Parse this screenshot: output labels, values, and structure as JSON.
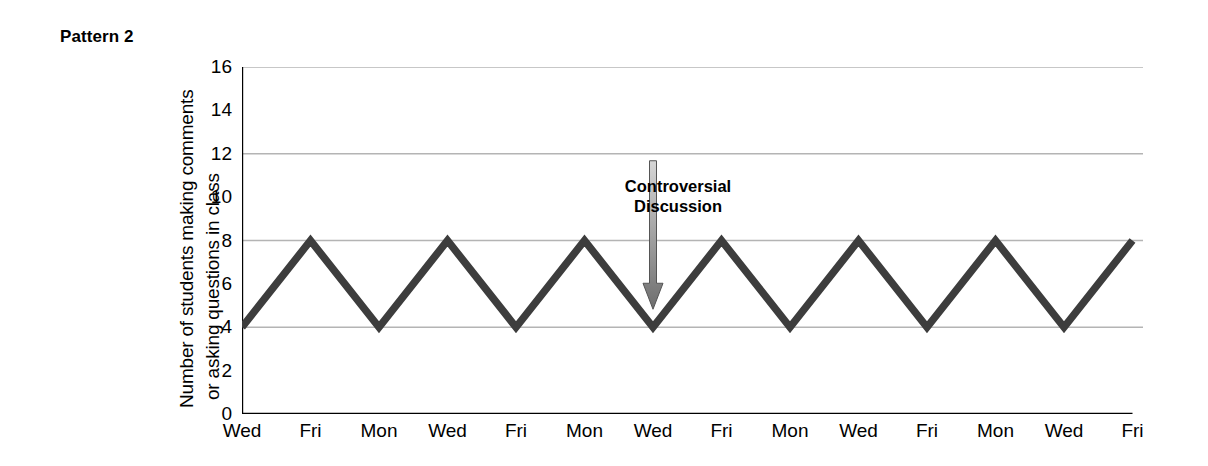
{
  "figure": {
    "pattern_label": "Pattern 2"
  },
  "annotation": {
    "line1": "Controversial",
    "line2": "Discussion",
    "arrow_icon": "down-arrow-icon",
    "arrow_color_top": "#d6d6d6",
    "arrow_color_bottom": "#6e6e6e",
    "points_at_category": "Wed",
    "points_at_index": 6,
    "points_at_value": 4
  },
  "colors": {
    "line": "#3d3d3d",
    "axis": "#000000",
    "gridline": "#b4b4b4",
    "text": "#000000",
    "background": "#ffffff"
  },
  "chart_data": {
    "type": "line",
    "title": "Pattern 2",
    "xlabel": "",
    "ylabel": "Number of students making comments or asking questions in class",
    "ylabel_lines": [
      "Number of students making comments",
      "or asking questions in class"
    ],
    "categories": [
      "Wed",
      "Fri",
      "Mon",
      "Wed",
      "Fri",
      "Mon",
      "Wed",
      "Fri",
      "Mon",
      "Wed",
      "Fri",
      "Mon",
      "Wed",
      "Fri"
    ],
    "values": [
      4,
      8,
      4,
      8,
      4,
      8,
      4,
      8,
      4,
      8,
      4,
      8,
      4,
      8
    ],
    "ylim": [
      0,
      16
    ],
    "xlim": [
      0,
      13
    ],
    "ytick_values": [
      0,
      2,
      4,
      6,
      8,
      10,
      12,
      14,
      16
    ],
    "ytick_labels": [
      "0",
      "2",
      "4",
      "6",
      "8",
      "10",
      "12",
      "14",
      "16"
    ],
    "yminor_tick_values": [
      1,
      3,
      5,
      7,
      9,
      11,
      13,
      15
    ],
    "gridline_values": [
      4,
      8,
      12,
      16
    ],
    "grid": true,
    "legend": false,
    "legend_position": "none",
    "annotations": [
      {
        "text": "Controversial Discussion",
        "target_x_index": 6,
        "target_y": 4
      }
    ]
  }
}
